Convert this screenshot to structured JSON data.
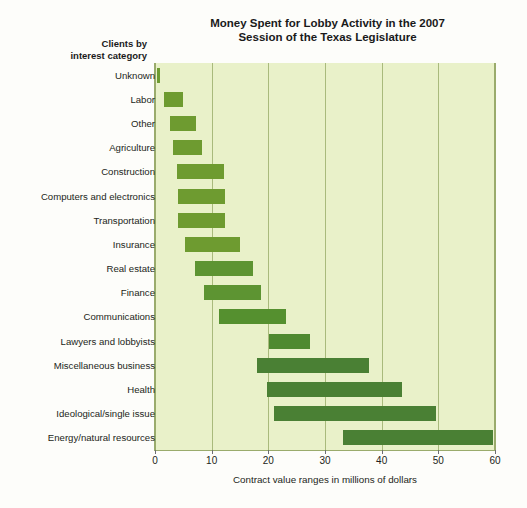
{
  "chart_data": {
    "type": "bar",
    "orientation": "horizontal",
    "subtype": "range-bar",
    "title": "Money Spent for Lobby Activity in the 2007 Session of the Texas Legislature",
    "title_line1": "Money Spent for Lobby Activity in the 2007",
    "title_line2": "Session of the Texas Legislature",
    "ylabel_line1": "Clients by",
    "ylabel_line2": "interest category",
    "ylabel": "Clients by interest category",
    "xlabel": "Contract value ranges in millions of dollars",
    "xlim": [
      0,
      60
    ],
    "xticks": [
      0,
      10,
      20,
      30,
      40,
      50,
      60
    ],
    "xtick_labels": [
      "0",
      "10",
      "20",
      "30",
      "40",
      "50",
      "60"
    ],
    "grid": true,
    "grid_axis": "x",
    "legend": "none",
    "plot_background": "#e9f1c9",
    "gridline_color": "#a9ba7c",
    "bar_color_light": "#6e9b30",
    "bar_color_dark": "#4a8034",
    "categories": [
      "Unknown",
      "Labor",
      "Other",
      "Agriculture",
      "Construction",
      "Computers and electronics",
      "Transportation",
      "Insurance",
      "Real estate",
      "Finance",
      "Communications",
      "Lawyers and lobbyists",
      "Miscellaneous business",
      "Health",
      "Ideological/single issue",
      "Energy/natural resources"
    ],
    "ranges": [
      {
        "category": "Unknown",
        "low": 0.3,
        "high": 0.9,
        "color": "#6e9b30"
      },
      {
        "category": "Labor",
        "low": 1.5,
        "high": 5.0,
        "color": "#6e9b30"
      },
      {
        "category": "Other",
        "low": 2.6,
        "high": 7.2,
        "color": "#6e9b30"
      },
      {
        "category": "Agriculture",
        "low": 3.2,
        "high": 8.3,
        "color": "#6e9b30"
      },
      {
        "category": "Construction",
        "low": 3.8,
        "high": 12.2,
        "color": "#6e9b30"
      },
      {
        "category": "Computers and electronics",
        "low": 4.0,
        "high": 12.4,
        "color": "#6e9b30"
      },
      {
        "category": "Transportation",
        "low": 4.0,
        "high": 12.4,
        "color": "#6e9b30"
      },
      {
        "category": "Insurance",
        "low": 5.3,
        "high": 15.0,
        "color": "#6e9b30"
      },
      {
        "category": "Real estate",
        "low": 7.1,
        "high": 17.3,
        "color": "#5d9432"
      },
      {
        "category": "Finance",
        "low": 8.6,
        "high": 18.7,
        "color": "#5d9432"
      },
      {
        "category": "Communications",
        "low": 11.3,
        "high": 23.1,
        "color": "#55902f"
      },
      {
        "category": "Lawyers and lobbyists",
        "low": 20.2,
        "high": 27.3,
        "color": "#4f8a30"
      },
      {
        "category": "Miscellaneous business",
        "low": 18.0,
        "high": 37.7,
        "color": "#4a8034"
      },
      {
        "category": "Health",
        "low": 19.8,
        "high": 43.6,
        "color": "#4a8034"
      },
      {
        "category": "Ideological/single issue",
        "low": 21.0,
        "high": 49.6,
        "color": "#4a8034"
      },
      {
        "category": "Energy/natural resources",
        "low": 33.2,
        "high": 59.7,
        "color": "#4a8034"
      }
    ]
  }
}
